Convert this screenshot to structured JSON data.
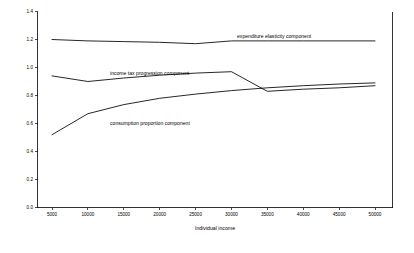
{
  "chart_data": {
    "type": "line",
    "title": "",
    "xlabel": "Individual income",
    "ylabel": "",
    "xlim": [
      5000,
      50000
    ],
    "ylim": [
      0.0,
      1.4
    ],
    "grid": false,
    "legend_position": "inline-annotations",
    "x": [
      5000,
      10000,
      15000,
      20000,
      25000,
      30000,
      35000,
      40000,
      45000,
      50000
    ],
    "xticks": [
      "5000",
      "10000",
      "15000",
      "20000",
      "25000",
      "30000",
      "35000",
      "40000",
      "45000",
      "50000"
    ],
    "yticks": [
      "0.0",
      "0.2",
      "0.4",
      "0.6",
      "0.8",
      "1.0",
      "1.2",
      "1.4"
    ],
    "series": [
      {
        "name": "expenditure elasticity component",
        "values": [
          1.2,
          1.19,
          1.185,
          1.18,
          1.17,
          1.19,
          1.19,
          1.19,
          1.19,
          1.19
        ],
        "annotation": "expenditure elasticity component"
      },
      {
        "name": "income tax progression component",
        "values": [
          0.94,
          0.9,
          0.925,
          0.945,
          0.96,
          0.97,
          0.83,
          0.845,
          0.855,
          0.87
        ],
        "annotation": "income tax progression component"
      },
      {
        "name": "consumption proportion component",
        "values": [
          0.52,
          0.67,
          0.735,
          0.78,
          0.81,
          0.835,
          0.855,
          0.87,
          0.882,
          0.89
        ],
        "annotation": "consumption proportion component"
      }
    ],
    "annotations": [
      {
        "text": "expenditure elasticity component",
        "x": 237,
        "y": 38
      },
      {
        "text": "income tax progression component",
        "x": 110,
        "y": 75
      },
      {
        "text": "consumption proportion component",
        "x": 110,
        "y": 125
      }
    ],
    "colors": {
      "line": "#000000",
      "axis": "#000000",
      "background": "#ffffff"
    }
  }
}
